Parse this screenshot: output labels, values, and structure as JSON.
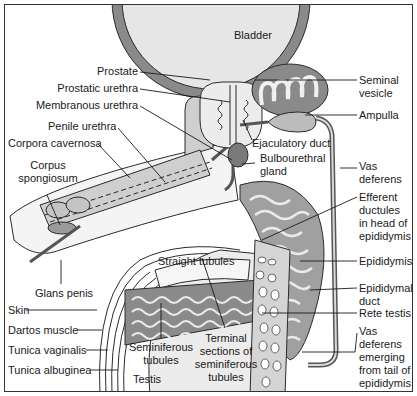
{
  "diagram": {
    "colors": {
      "outline": "#2a2a2a",
      "dark_fill": "#7a7a7a",
      "mid_fill": "#a8a8a8",
      "light_fill": "#d8d8d8",
      "pale_fill": "#ebebeb",
      "background": "#ffffff"
    },
    "labels": {
      "bladder": "Bladder",
      "prostate": "Prostate",
      "prostatic_urethra": "Prostatic urethra",
      "membranous_urethra": "Membranous urethra",
      "penile_urethra": "Penile urethra",
      "corpora_cavernosa": "Corpora cavernosa",
      "corpus_spongiosum_1": "Corpus",
      "corpus_spongiosum_2": "spongiosum",
      "glans_penis": "Glans penis",
      "skin": "Skin",
      "dartos_muscle": "Dartos muscle",
      "tunica_vaginalis": "Tunica vaginalis",
      "tunica_albuginea": "Tunica albuginea",
      "testis": "Testis",
      "seminiferous_tubules_1": "Seminiferous",
      "seminiferous_tubules_2": "tubules",
      "straight_tubules": "Straight tubules",
      "terminal_sections_1": "Terminal",
      "terminal_sections_2": "sections of",
      "terminal_sections_3": "seminiferous",
      "terminal_sections_4": "tubules",
      "seminal_vesicle_1": "Seminal",
      "seminal_vesicle_2": "vesicle",
      "ampulla": "Ampulla",
      "ejaculatory_duct": "Ejaculatory duct",
      "bulbourethral_gland_1": "Bulbourethral",
      "bulbourethral_gland_2": "gland",
      "vas_deferens_1": "Vas",
      "vas_deferens_2": "deferens",
      "efferent_ductules_1": "Efferent",
      "efferent_ductules_2": "ductules",
      "efferent_ductules_3": "in head of",
      "efferent_ductules_4": "epididymis",
      "epididymis": "Epididymis",
      "epididymal_duct_1": "Epididymal",
      "epididymal_duct_2": "duct",
      "rete_testis": "Rete testis",
      "vas_emerging_1": "Vas",
      "vas_emerging_2": "deferens",
      "vas_emerging_3": "emerging",
      "vas_emerging_4": "from tail of",
      "vas_emerging_5": "epididymis"
    }
  }
}
